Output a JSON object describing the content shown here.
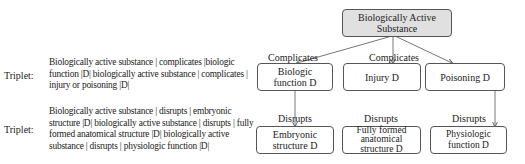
{
  "triplets": [
    {
      "label": "Triplet:",
      "text": "Biologically active substance | complicates |biologic function |D| biologically active substance | complicates | injury or poisoning |D|"
    },
    {
      "label": "Triplet:",
      "text": "Biologically active substance | disrupts | embryonic structure |D| biologically active substance | disrupts | fully formed anatomical structure |D| biologically active substance | disrupts | physiologic function |D|"
    }
  ],
  "diagram": {
    "root": "Biologically Active Substance",
    "complicates_label": "Complicates",
    "disrupts_label": "Disrupts",
    "middle": [
      "Biologic function D",
      "Injury D",
      "Poisoning D"
    ],
    "bottom": [
      "Embryonic structure D",
      "Fully formed anatomical structure D",
      "Physiologic function D"
    ]
  },
  "colors": {
    "root_fill": "#e0e0e0",
    "stroke": "#555555"
  }
}
